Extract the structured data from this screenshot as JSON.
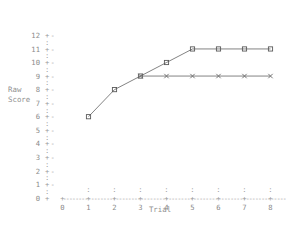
{
  "chart_data": {
    "type": "line",
    "title": "",
    "subtitle": "",
    "xlabel": "Trial",
    "ylabel": "Raw Score",
    "ylabel_lines": [
      "Raw",
      "Score"
    ],
    "x": [
      1,
      2,
      3,
      4,
      5,
      6,
      7,
      8
    ],
    "xlim": [
      0,
      8
    ],
    "ylim": [
      0,
      12
    ],
    "xticks": [
      0,
      1,
      2,
      3,
      4,
      5,
      6,
      7,
      8
    ],
    "yticks": [
      0,
      1,
      2,
      3,
      4,
      5,
      6,
      7,
      8,
      9,
      10,
      11,
      12
    ],
    "xtick_labels": [
      "0",
      "1",
      "2",
      "3",
      "4",
      "5",
      "6",
      "7",
      "8"
    ],
    "ytick_labels": [
      "0",
      "1",
      "2",
      "3",
      "4",
      "5",
      "6",
      "7",
      "8",
      "9",
      "10",
      "11",
      "12"
    ],
    "grid": false,
    "legend": "none",
    "axis_tick_glyph": "+",
    "axis_minor_glyph": ":",
    "axis_dash_glyph": "-",
    "series": [
      {
        "name": "upper-series",
        "marker": "square",
        "x": [
          1,
          2,
          3,
          4,
          5,
          6,
          7,
          8
        ],
        "values": [
          6,
          8,
          9,
          10,
          11,
          11,
          11,
          11
        ]
      },
      {
        "name": "lower-series",
        "marker": "cross",
        "x": [
          3,
          4,
          5,
          6,
          7,
          8
        ],
        "values": [
          9,
          9,
          9,
          9,
          9,
          9
        ]
      }
    ]
  },
  "axes": {
    "x_title": "Trial",
    "y_title_line1": "Raw",
    "y_title_line2": "Score"
  }
}
